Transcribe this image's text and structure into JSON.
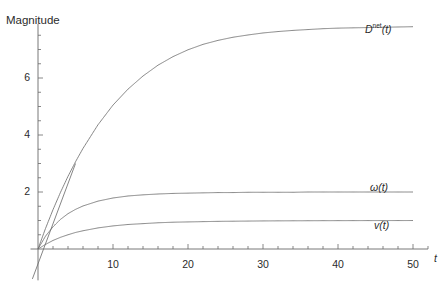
{
  "chart_data": {
    "type": "line",
    "title": "",
    "ylabel": "Magnitude",
    "xlabel": "t",
    "xlim": [
      -1,
      52
    ],
    "ylim": [
      -1.1,
      7.9
    ],
    "grid": false,
    "legend_position": "inline-right-of-curve",
    "x_ticks_major": [
      10,
      20,
      30,
      40,
      50
    ],
    "x_tick_labels": [
      "10",
      "20",
      "30",
      "40",
      "50"
    ],
    "x_minor_step": 2,
    "y_ticks_major": [
      2,
      4,
      6
    ],
    "y_tick_labels": [
      "2",
      "4",
      "6"
    ],
    "y_minor_step": 0.5,
    "x": [
      0,
      1,
      2,
      3,
      4,
      5,
      6,
      8,
      10,
      12,
      14,
      16,
      18,
      20,
      22,
      24,
      26,
      28,
      30,
      32,
      34,
      36,
      38,
      40,
      42,
      44,
      46,
      48,
      50
    ],
    "series": [
      {
        "name": "D^net(t)",
        "label_text": "D",
        "label_sup": "net",
        "label_suffix": "(t)",
        "color": "#6f6f6f",
        "plateau": 7.2,
        "values": [
          0,
          0.72,
          1.38,
          1.99,
          2.55,
          3.06,
          3.53,
          4.36,
          5.05,
          5.61,
          6.07,
          6.45,
          6.75,
          6.99,
          7.18,
          7.32,
          7.43,
          7.51,
          7.58,
          7.63,
          7.67,
          7.7,
          7.73,
          7.75,
          7.76,
          7.77,
          7.78,
          7.79,
          7.8
        ],
        "label_x": 44,
        "label_y": 7.9
      },
      {
        "name": "omega(t)",
        "label_text": "ω(t)",
        "color": "#6f6f6f",
        "plateau": 2.0,
        "values": [
          0,
          0.45,
          0.78,
          1.04,
          1.24,
          1.39,
          1.51,
          1.68,
          1.79,
          1.86,
          1.9,
          1.93,
          1.95,
          1.96,
          1.97,
          1.98,
          1.98,
          1.99,
          1.99,
          1.99,
          1.99,
          2.0,
          2.0,
          2.0,
          2.0,
          2.0,
          2.0,
          2.0,
          2.0
        ],
        "label_x": 44,
        "label_y": 2.45
      },
      {
        "name": "v(t)",
        "label_text": "v(t)",
        "color": "#6f6f6f",
        "plateau": 1.0,
        "values": [
          0,
          0.16,
          0.3,
          0.41,
          0.5,
          0.58,
          0.64,
          0.74,
          0.81,
          0.86,
          0.89,
          0.92,
          0.94,
          0.95,
          0.96,
          0.97,
          0.975,
          0.98,
          0.985,
          0.988,
          0.99,
          0.992,
          0.994,
          0.995,
          0.996,
          0.997,
          0.998,
          0.998,
          0.999
        ],
        "label_x": 44,
        "label_y": 1.35
      }
    ],
    "tangent_line": {
      "name": "initial-slope-line",
      "color": "#6f6f6f",
      "x0": -0.75,
      "y0": -1.05,
      "x1": 5.0,
      "y1": 3.0
    }
  },
  "axis_labels": {
    "y_title": "Magnitude",
    "x_title": "t"
  }
}
